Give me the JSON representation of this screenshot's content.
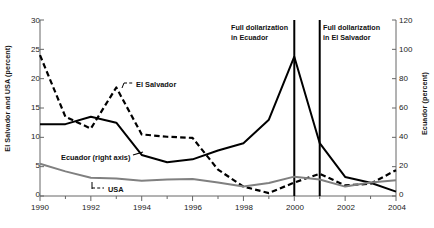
{
  "chart_data": {
    "type": "line",
    "title": "",
    "subtitle": "",
    "xlabel": "",
    "ylabel": "El Salvador and USA (percent)",
    "y2label": "Ecuador (percent)",
    "x": [
      1990,
      1991,
      1992,
      1993,
      1994,
      1995,
      1996,
      1997,
      1998,
      1999,
      2000,
      2001,
      2002,
      2003,
      2004
    ],
    "xlim": [
      1990,
      2004
    ],
    "xticks": [
      1990,
      1992,
      1994,
      1996,
      1998,
      2000,
      2002,
      2004
    ],
    "xticklabels": [
      "1990",
      "1992",
      "1994",
      "1996",
      "1998",
      "2000",
      "2002",
      "2004"
    ],
    "xminorticks": [
      1991,
      1993,
      1995,
      1997,
      1999,
      2001,
      2003
    ],
    "ylim": [
      0,
      30
    ],
    "yticks": [
      0,
      5,
      10,
      15,
      20,
      25,
      30
    ],
    "yticklabels": [
      "0",
      "5",
      "10",
      "15",
      "20",
      "25",
      "30"
    ],
    "y2lim": [
      0,
      120
    ],
    "y2ticks": [
      0,
      20,
      40,
      60,
      80,
      100,
      120
    ],
    "y2ticklabels": [
      "0",
      "20",
      "40",
      "60",
      "80",
      "100",
      "120"
    ],
    "grid": false,
    "legend_position": "inline-labels",
    "series": [
      {
        "name": "El Salvador",
        "axis": "left",
        "style": "dashed",
        "color": "#000000",
        "values": [
          24.0,
          13.5,
          11.5,
          18.5,
          10.5,
          10.1,
          9.9,
          4.5,
          1.6,
          0.5,
          2.3,
          3.8,
          1.8,
          2.1,
          4.4
        ]
      },
      {
        "name": "Ecuador (right axis)",
        "axis": "right",
        "style": "solid",
        "color": "#000000",
        "values": [
          49,
          49,
          54,
          50,
          28,
          23,
          25,
          31,
          36,
          52,
          95,
          36,
          13,
          9,
          3
        ]
      },
      {
        "name": "USA",
        "axis": "left",
        "style": "solid",
        "color": "#808080",
        "values": [
          5.5,
          4.2,
          3.1,
          3.0,
          2.6,
          2.8,
          2.9,
          2.3,
          1.6,
          2.2,
          3.3,
          2.8,
          1.6,
          2.3,
          2.7
        ]
      }
    ],
    "annotations": [
      {
        "id": "ecuador-dollarization",
        "text_line1": "Full dollarization",
        "text_line2": "in Ecuador",
        "x": 2000,
        "type": "vertical-line"
      },
      {
        "id": "elsalvador-dollarization",
        "text_line1": "Full dollarization",
        "text_line2": "in El Salvador",
        "x": 2001,
        "type": "vertical-line"
      }
    ],
    "series_labels": [
      {
        "name": "El Salvador",
        "label": "El Salvador"
      },
      {
        "name": "Ecuador",
        "label": "Ecuador (right axis)"
      },
      {
        "name": "USA",
        "label": "USA"
      }
    ],
    "colors": {
      "axis": "#1a1a1a",
      "el_salvador": "#000000",
      "ecuador": "#000000",
      "usa": "#808080",
      "background": "#ffffff"
    }
  }
}
